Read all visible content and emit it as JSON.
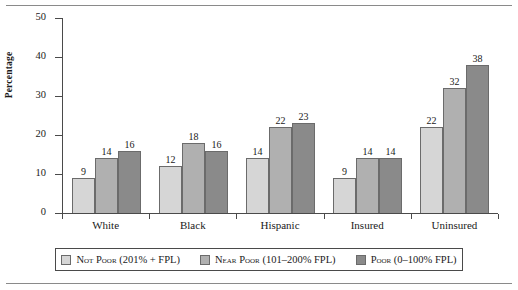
{
  "chart_data": {
    "type": "bar",
    "title": "",
    "xlabel": "",
    "ylabel": "Percentage",
    "ylim": [
      0,
      50
    ],
    "yticks": [
      0,
      10,
      20,
      30,
      40,
      50
    ],
    "grid": false,
    "legend_position": "bottom",
    "categories": [
      "White",
      "Black",
      "Hispanic",
      "Insured",
      "Uninsured"
    ],
    "series": [
      {
        "name": "Not Poor (201% + FPL)",
        "color": "#d6d6d6",
        "values": [
          9,
          12,
          14,
          9,
          22
        ]
      },
      {
        "name": "Near Poor (101–200% FPL)",
        "color": "#b0b0b0",
        "values": [
          14,
          18,
          22,
          14,
          32
        ]
      },
      {
        "name": "Poor (0–100% FPL)",
        "color": "#8a8a8a",
        "values": [
          16,
          16,
          23,
          14,
          38
        ]
      }
    ]
  },
  "axis": {
    "y_title": "Percentage",
    "y_tick_labels": [
      "0",
      "10",
      "20",
      "30",
      "40",
      "50"
    ]
  },
  "legend": {
    "items": [
      {
        "label": "Not Poor (201% + FPL)"
      },
      {
        "label": "Near Poor (101–200% FPL)"
      },
      {
        "label": "Poor (0–100% FPL)"
      }
    ]
  }
}
